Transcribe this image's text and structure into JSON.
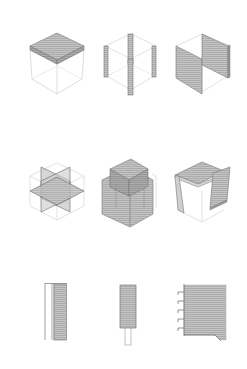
{
  "diagram": {
    "type": "architectural-axonometric-study",
    "layout": {
      "rows": 3,
      "columns": 3
    },
    "colors": {
      "background": "#ffffff",
      "wireframe": "#c8c8c8",
      "fill": "#b9b9b9",
      "fill_dark": "#9a9a9a",
      "hatch": "#8f8f8f",
      "edge": "#6e6e6e"
    },
    "rows": [
      {
        "name": "cube-elements",
        "items": [
          {
            "id": "roof-slab",
            "description": "Wireframe cube with hatched slab on top face"
          },
          {
            "id": "corner-columns",
            "description": "Wireframe cube with four hatched corner columns"
          },
          {
            "id": "opposing-walls",
            "description": "Wireframe cube with two hatched parallel walls"
          }
        ]
      },
      {
        "name": "cube-combinations",
        "items": [
          {
            "id": "intersecting-planes",
            "description": "Cube with intersecting horizontal and vertical planes"
          },
          {
            "id": "stacked-volumes",
            "description": "Solid hatched volume with smaller cube on top"
          },
          {
            "id": "open-frame",
            "description": "Cube with roof slab and side wall, open front"
          }
        ]
      },
      {
        "name": "sections",
        "items": [
          {
            "id": "wall-section",
            "description": "Vertical section with double line and hatched wall"
          },
          {
            "id": "column-section",
            "description": "Vertical hatched column section on narrow base"
          },
          {
            "id": "floor-section",
            "description": "Hatched wall with stepped ribs on left edge"
          }
        ]
      }
    ]
  }
}
